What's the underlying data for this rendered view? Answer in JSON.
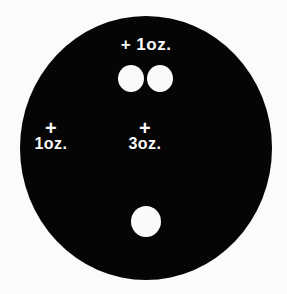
{
  "diagram": {
    "labels": {
      "top": "+ 1oz.",
      "left_plus": "+",
      "left_weight": "1oz.",
      "center_plus": "+",
      "center_weight": "3oz."
    },
    "colors": {
      "disc": "#050505",
      "holes": "#fafafa",
      "background": "#fbfbfb"
    }
  }
}
